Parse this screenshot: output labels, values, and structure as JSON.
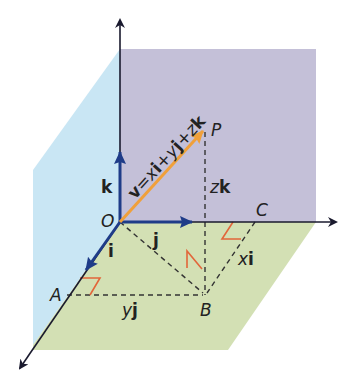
{
  "diagram": {
    "colors": {
      "blue_wall": "#c9e6f4",
      "purple_wall": "#c4c0d8",
      "green_floor": "#d3e0b4",
      "axis": "#1a1a2e",
      "unit_vector": "#1f3c88",
      "position_vector": "#f0a03a",
      "right_angle": "#e2663a",
      "dashed": "#333333"
    },
    "points": {
      "O": "O",
      "P": "P",
      "A": "A",
      "B": "B",
      "C": "C"
    },
    "unit_vectors": {
      "i": "i",
      "j": "j",
      "k": "k"
    },
    "components": {
      "xi_scalar": "x",
      "xi_vec": "i",
      "yj_scalar": "y",
      "yj_vec": "j",
      "zk_scalar": "z",
      "zk_vec": "k"
    },
    "equation": {
      "v": "v",
      "eq": "=",
      "x": "x",
      "i": "i",
      "plus1": "+",
      "y": "y",
      "j": "j",
      "plus2": "+",
      "z": "z",
      "k": "k"
    }
  }
}
